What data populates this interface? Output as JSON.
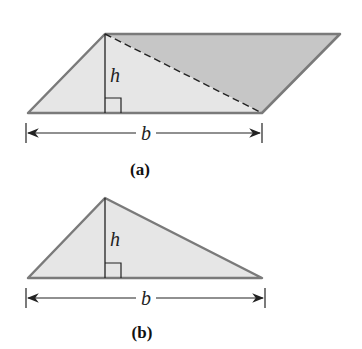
{
  "figure_a": {
    "caption": "(a)",
    "height_label": "h",
    "base_label": "b",
    "shape": "parallelogram split by dashed diagonal into two triangles"
  },
  "figure_b": {
    "caption": "(b)",
    "height_label": "h",
    "base_label": "b",
    "shape": "triangle"
  },
  "colors": {
    "light_fill": "#e6e6e6",
    "dark_fill": "#c6c6c6",
    "outline": "#7a7a7a",
    "line": "#222222"
  }
}
